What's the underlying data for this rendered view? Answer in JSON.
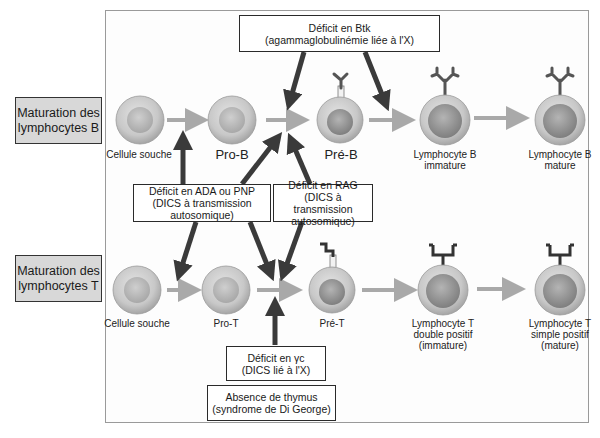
{
  "diagram": {
    "colors": {
      "frame_border": "#9a9a9a",
      "stage_box_fill": "#d8d8d8",
      "cell_outer": "#c9c9c9",
      "cell_nucleus": "#a8a8a8",
      "maturation_arrow": "#a9a9a9",
      "defect_arrow": "#3a3a3a",
      "receptor": "#555555"
    },
    "rows": [
      {
        "id": "b",
        "label": "Maturation des lymphocytes B",
        "label_line1": "Maturation des",
        "label_line2": "lymphocytes B",
        "stages": [
          {
            "id": "cellule-souche-b",
            "line1": "Cellule souche",
            "line2": "",
            "receptor": "none"
          },
          {
            "id": "pro-b",
            "line1": "Pro-B",
            "line2": "",
            "receptor": "none"
          },
          {
            "id": "pre-b",
            "line1": "Pré-B",
            "line2": "",
            "receptor": "pre-bcr"
          },
          {
            "id": "lb-immature",
            "line1": "Lymphocyte B",
            "line2": "immature",
            "receptor": "bcr"
          },
          {
            "id": "lb-mature",
            "line1": "Lymphocyte B",
            "line2": "mature",
            "receptor": "bcr"
          }
        ]
      },
      {
        "id": "t",
        "label": "Maturation des lymphocytes T",
        "label_line1": "Maturation des",
        "label_line2": "lymphocytes T",
        "stages": [
          {
            "id": "cellule-souche-t",
            "line1": "Cellule souche",
            "line2": "",
            "line3": "",
            "receptor": "none"
          },
          {
            "id": "pro-t",
            "line1": "Pro-T",
            "line2": "",
            "line3": "",
            "receptor": "none"
          },
          {
            "id": "pre-t",
            "line1": "Pré-T",
            "line2": "",
            "line3": "",
            "receptor": "pre-tcr"
          },
          {
            "id": "lt-double-positif",
            "line1": "Lymphocyte T",
            "line2": "double positif",
            "line3": "(immature)",
            "receptor": "tcr"
          },
          {
            "id": "lt-simple-positif",
            "line1": "Lymphocyte T",
            "line2": "simple positif",
            "line3": "(mature)",
            "receptor": "tcr"
          }
        ]
      }
    ],
    "defects": [
      {
        "id": "btk",
        "line1": "Déficit en Btk",
        "line2": "(agammaglobulinémie liée à l'X)",
        "line3": "",
        "blocks": [
          "pro-b → pré-b",
          "pré-b → lymphocyte b immature"
        ]
      },
      {
        "id": "ada-pnp",
        "line1": "Déficit en ADA ou PNP",
        "line2": "(DICS à transmission",
        "line3": "autosomique)",
        "blocks": [
          "cellule souche → pro-b",
          "pro-b → pré-b",
          "cellule souche → pro-t",
          "pro-t → pré-t"
        ]
      },
      {
        "id": "rag",
        "line1": "Déficit en RAG",
        "line2": "(DICS à transmission",
        "line3": "autosomique)",
        "blocks": [
          "pro-b → pré-b",
          "pro-t → pré-t"
        ]
      },
      {
        "id": "gamma-c",
        "line1": "Déficit en γc",
        "line2": "(DICS lié à l'X)",
        "line3": "",
        "blocks": [
          "pro-t → pré-t"
        ]
      },
      {
        "id": "thymus",
        "line1": "Absence de thymus",
        "line2": "(syndrome de Di George)",
        "line3": "",
        "blocks": [
          "pro-t → pré-t"
        ]
      }
    ]
  }
}
